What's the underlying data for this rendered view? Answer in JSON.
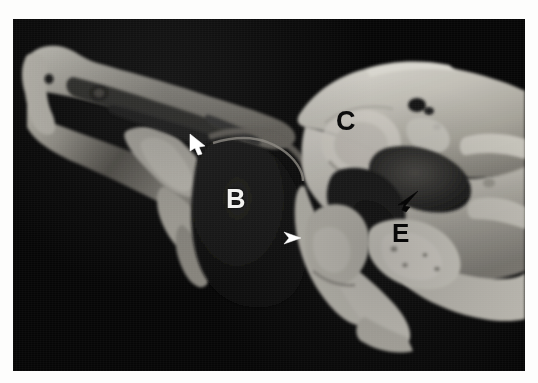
{
  "figure": {
    "kind": "anatomical-specimen-photograph",
    "modality": "gross anatomy colour photograph (greyscale)",
    "caption_visible": false,
    "background_color": "#070707",
    "page_color": "#ffffff",
    "plate": {
      "x": 13,
      "y": 19,
      "width": 512,
      "height": 352
    }
  },
  "labels": [
    {
      "id": "B",
      "text": "B",
      "color": "#f2f2f0",
      "style": "bold white serif-less capital",
      "position": {
        "x": 247,
        "y": 207
      },
      "region": "dark nasopharyngeal / choanal air space"
    },
    {
      "id": "C",
      "text": "C",
      "color": "#0b0b0b",
      "style": "bold black capital",
      "position": {
        "x": 348,
        "y": 124
      },
      "region": "pale bony recess in upper skull-base block"
    },
    {
      "id": "E",
      "text": "E",
      "color": "#080808",
      "style": "bold black capital",
      "position": {
        "x": 404,
        "y": 236
      },
      "region": "lower pale bony prominence"
    }
  ],
  "markers": [
    {
      "id": "arrow-white-turbinate",
      "type": "arrow",
      "color": "#ffffff",
      "direction": "down-right",
      "tip": {
        "x": 205,
        "y": 150
      }
    },
    {
      "id": "arrowhead-white-skullbase",
      "type": "arrowhead",
      "color": "#ffffff",
      "direction": "right",
      "tip": {
        "x": 300,
        "y": 238
      }
    },
    {
      "id": "arrow-black-sphenoid",
      "type": "arrow",
      "color": "#000000",
      "direction": "down-left",
      "tip": {
        "x": 400,
        "y": 208
      }
    }
  ],
  "specimen": {
    "description": "Sagittally sectioned skull specimen: elongated pale nasal / palatal strip running from upper-left to centre, a large dark air cavity in the centre, and a bulky pale skull-base block occupying the right half.",
    "tones": {
      "bone_light": "#d8d6cf",
      "bone_mid": "#b3b0a7",
      "bone_shadow": "#6e6b64",
      "cavity_dark": "#121212",
      "cavity_mid": "#3a3a38",
      "background": "#070707"
    }
  }
}
